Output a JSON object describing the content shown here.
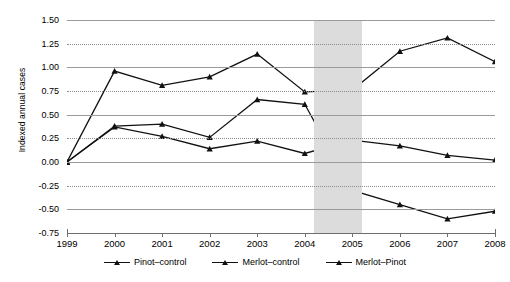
{
  "chart_data": {
    "type": "line",
    "title": "",
    "xlabel": "",
    "ylabel": "Indexed annual cases",
    "categories": [
      "1999",
      "2000",
      "2001",
      "2002",
      "2003",
      "2004",
      "2005",
      "2006",
      "2007",
      "2008"
    ],
    "x": [
      1999,
      2000,
      2001,
      2002,
      2003,
      2004,
      2005,
      2006,
      2007,
      2008
    ],
    "ylim": [
      -0.75,
      1.5
    ],
    "ytick_labels": [
      "1.50",
      "1.25",
      "1.00",
      "0.75",
      "0.50",
      "0.25",
      "0.00",
      "-0.25",
      "-0.50",
      "-0.75"
    ],
    "ytick_values": [
      1.5,
      1.25,
      1.0,
      0.75,
      0.5,
      0.25,
      0.0,
      -0.25,
      -0.5,
      -0.75
    ],
    "grid": true,
    "grid_axis": "y",
    "legend_position": "bottom",
    "marker": "triangle",
    "line_color": "#111111",
    "series": [
      {
        "name": "Pinot-control",
        "label": "Pinot–control",
        "values": [
          0.0,
          0.37,
          0.27,
          0.14,
          0.22,
          0.09,
          0.23,
          0.17,
          0.07,
          0.02
        ]
      },
      {
        "name": "Merlot-control",
        "label": "Merlot–control",
        "values": [
          0.0,
          0.96,
          0.81,
          0.9,
          1.14,
          0.74,
          0.76,
          1.17,
          1.31,
          1.06
        ]
      },
      {
        "name": "Merlot-Pinot",
        "label": "Merlot–Pinot",
        "values": [
          0.0,
          0.38,
          0.4,
          0.26,
          0.66,
          0.61,
          -0.3,
          -0.45,
          -0.6,
          -0.52
        ]
      }
    ],
    "shaded_region": {
      "label": "",
      "x_start": 2004.2,
      "x_end": 2005.2,
      "color": "#dcdcdc"
    }
  },
  "legend": {
    "items": [
      {
        "label": "Pinot–control"
      },
      {
        "label": "Merlot–control"
      },
      {
        "label": "Merlot–Pinot"
      }
    ]
  },
  "axes": {
    "y_title": "Indexed annual cases"
  }
}
